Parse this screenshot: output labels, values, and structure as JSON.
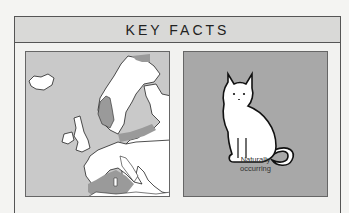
{
  "header": {
    "title": "KEY FACTS"
  },
  "map": {
    "icon": "europe-distribution-map",
    "colors": {
      "sea": "#c9c9c9",
      "land": "#ffffff",
      "range": "#9a9a9a",
      "outline": "#222222"
    }
  },
  "cat": {
    "icon": "sitting-cat-illustration",
    "caption_line1": "Naturally",
    "caption_line2": "occurring",
    "colors": {
      "background": "#a8a8a8",
      "body": "#ffffff",
      "outline": "#111111"
    }
  }
}
